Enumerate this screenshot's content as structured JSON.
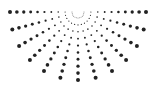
{
  "graphic": {
    "name": "radial-dot-sunburst",
    "width": 156,
    "height": 87,
    "background": "#ffffff",
    "dot_color": "#222222",
    "center": {
      "x": 78,
      "y": 12
    },
    "ray_count": 13,
    "angle_start_deg": 0,
    "angle_end_deg": 180,
    "dots_per_ray": 10,
    "inner_radius": 6,
    "outer_radius": 68,
    "min_dot_radius": 0.4,
    "max_dot_radius": 2.0
  }
}
